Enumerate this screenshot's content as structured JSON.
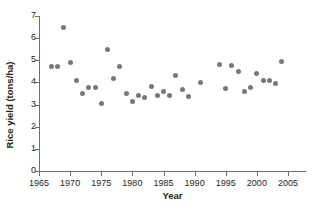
{
  "chart_data": {
    "type": "scatter",
    "title": "",
    "xlabel": "Year",
    "ylabel": "Rice yield (tons/ha)",
    "xlim": [
      1965,
      2006
    ],
    "ylim": [
      0,
      7
    ],
    "xticks": [
      1965,
      1970,
      1975,
      1980,
      1985,
      1990,
      1995,
      2000,
      2005
    ],
    "yticks": [
      0,
      1,
      2,
      3,
      4,
      5,
      6,
      7
    ],
    "grid": false,
    "legend": null,
    "marker_color": "#77787b",
    "axis_color": "#6d6e70",
    "points": [
      {
        "x": 1967,
        "y": 4.7
      },
      {
        "x": 1968,
        "y": 4.7
      },
      {
        "x": 1969,
        "y": 6.5
      },
      {
        "x": 1970,
        "y": 4.92
      },
      {
        "x": 1971,
        "y": 4.1
      },
      {
        "x": 1972,
        "y": 3.5
      },
      {
        "x": 1973,
        "y": 3.75
      },
      {
        "x": 1974,
        "y": 3.75
      },
      {
        "x": 1975,
        "y": 3.05
      },
      {
        "x": 1976,
        "y": 5.5
      },
      {
        "x": 1977,
        "y": 4.2
      },
      {
        "x": 1978,
        "y": 4.72
      },
      {
        "x": 1979,
        "y": 3.5
      },
      {
        "x": 1980,
        "y": 3.15
      },
      {
        "x": 1981,
        "y": 3.4
      },
      {
        "x": 1982,
        "y": 3.3
      },
      {
        "x": 1983,
        "y": 3.8
      },
      {
        "x": 1984,
        "y": 3.4
      },
      {
        "x": 1985,
        "y": 3.6
      },
      {
        "x": 1986,
        "y": 3.42
      },
      {
        "x": 1987,
        "y": 4.33
      },
      {
        "x": 1988,
        "y": 3.68
      },
      {
        "x": 1989,
        "y": 3.35
      },
      {
        "x": 1991,
        "y": 3.98
      },
      {
        "x": 1994,
        "y": 4.82
      },
      {
        "x": 1995,
        "y": 3.72
      },
      {
        "x": 1996,
        "y": 4.75
      },
      {
        "x": 1997,
        "y": 4.5
      },
      {
        "x": 1998,
        "y": 3.6
      },
      {
        "x": 1999,
        "y": 3.78
      },
      {
        "x": 2000,
        "y": 4.4
      },
      {
        "x": 2001,
        "y": 4.08
      },
      {
        "x": 2002,
        "y": 4.07
      },
      {
        "x": 2003,
        "y": 3.97
      },
      {
        "x": 2004,
        "y": 4.95
      }
    ]
  }
}
